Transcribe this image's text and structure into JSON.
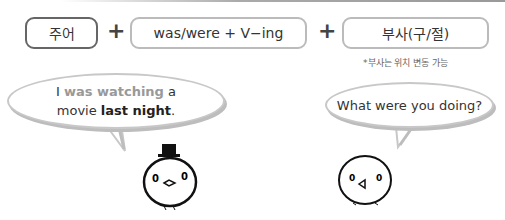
{
  "formula": {
    "subject_label": "주어",
    "plus1": "+",
    "verb_label": "was/were + V−ing",
    "plus2": "+",
    "adverb_label": "부사(구/절)",
    "note": "*부사는 위치 변동 가능"
  },
  "left_bubble": {
    "part1": "I ",
    "part2": "was watching",
    "part3": " a",
    "part4": "movie ",
    "part5": "last night",
    "part6": "."
  },
  "right_bubble": {
    "text": "What were you doing?"
  },
  "colors": {
    "highlight_gray": "#999999",
    "box_dark_border": "#666666",
    "box_light_border": "#bbbbbb"
  }
}
